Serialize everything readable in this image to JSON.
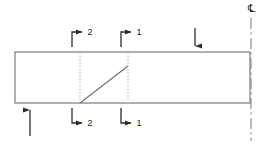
{
  "drawing": {
    "title": "Beam elevation with section cut markers",
    "colors": {
      "outline": "#6e6e6e",
      "section_line": "#9a9a9a",
      "diagonal": "#6b6b6b",
      "arrow": "#2b2b2b",
      "centerline": "#8a8a8a",
      "label_text": "#1a1a1a",
      "background": "#ffffff"
    },
    "body_outline": {
      "name": "beam-outline",
      "x": 15,
      "y": 52,
      "width": 235,
      "height": 51
    },
    "section_cuts": [
      {
        "id": "section-2",
        "label": "2",
        "x": 80,
        "top_marker_label": "2",
        "bottom_marker_label": "2"
      },
      {
        "id": "section-1",
        "label": "1",
        "x": 128,
        "top_marker_label": "1",
        "bottom_marker_label": "1"
      }
    ],
    "diagonal": {
      "name": "weld-taper-line",
      "x1": 80,
      "y1": 103,
      "x2": 128,
      "y2": 66
    },
    "load_arrows": [
      {
        "id": "top-load-arrow",
        "direction": "down",
        "x": 195,
        "from_y": 28,
        "to_y": 52
      },
      {
        "id": "bottom-reaction-arrow",
        "direction": "up",
        "x": 30,
        "from_y": 135,
        "to_y": 104
      }
    ],
    "centerline": {
      "name": "centerline",
      "x": 251,
      "top_y": 18,
      "bottom_y": 140,
      "symbol": "℄",
      "symbol_fallback": "C",
      "symbol_label": "centerline-symbol",
      "symbol_x": 251,
      "symbol_y": 11
    }
  }
}
